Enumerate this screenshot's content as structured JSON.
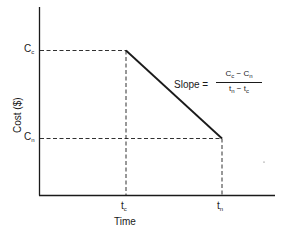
{
  "figure": {
    "y_axis_label": "Cost ($)",
    "x_axis_label": "Time",
    "y_ticks": [
      {
        "main": "C",
        "sub": "c"
      },
      {
        "main": "C",
        "sub": "n"
      }
    ],
    "x_ticks": [
      {
        "main": "t",
        "sub": "c"
      },
      {
        "main": "t",
        "sub": "n"
      }
    ],
    "slope_label": "Slope =",
    "slope_numerator": "C c − C n",
    "slope_numerator_parts": {
      "a": "C",
      "a_sub": "c",
      "op": "−",
      "b": "C",
      "b_sub": "n"
    },
    "slope_denominator_parts": {
      "a": "t",
      "a_sub": "n",
      "op": "−",
      "b": "t",
      "b_sub": "c"
    },
    "points": [
      {
        "name": "crash",
        "x": "tc",
        "y": "Cc"
      },
      {
        "name": "normal",
        "x": "tn",
        "y": "Cn"
      }
    ]
  }
}
